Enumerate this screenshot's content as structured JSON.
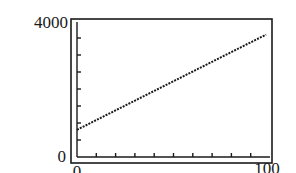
{
  "chart_data": {
    "type": "line",
    "title": "",
    "xlabel": "",
    "ylabel": "",
    "xlim": [
      0,
      100
    ],
    "ylim": [
      0,
      4000
    ],
    "x_tick_labels": [
      "0",
      "100"
    ],
    "y_tick_labels": [
      "0",
      "4000"
    ],
    "x_tick_count": 10,
    "y_tick_count": 8,
    "grid": false,
    "legend": null,
    "series": [
      {
        "name": "line",
        "style": "dotted",
        "x": [
          0,
          98
        ],
        "y": [
          800,
          3600
        ]
      }
    ]
  },
  "colors": {
    "axis": "#1a1a1a",
    "line": "#1a1a1a",
    "background": "#ffffff"
  }
}
